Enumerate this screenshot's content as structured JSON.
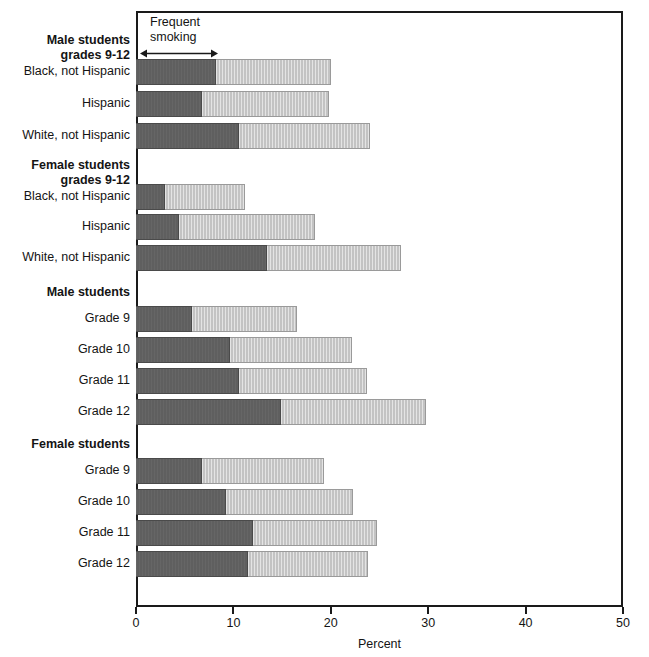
{
  "chart_data": {
    "type": "bar",
    "orientation": "horizontal",
    "stacked": true,
    "title": "",
    "xlabel": "Percent",
    "ylabel": "",
    "xlim": [
      0,
      50
    ],
    "xticks": [
      0,
      10,
      20,
      30,
      40,
      50
    ],
    "xtick_labels": [
      "0",
      "10",
      "20",
      "30",
      "40",
      "50"
    ],
    "grid": false,
    "legend_position": "none",
    "annotation": {
      "text_line1": "Frequent",
      "text_line2": "smoking",
      "arrow_from": 0,
      "arrow_to": 8
    },
    "series": [
      {
        "name": "Frequent smoking",
        "color": "#5f5f5f"
      },
      {
        "name": "Current smoking (remainder)",
        "color": "#c3c3c3"
      }
    ],
    "groups": [
      {
        "heading_line1": "Male students",
        "heading_line2": "grades 9-12",
        "rows": [
          {
            "label": "Black, not Hispanic",
            "frequent": 8.2,
            "total": 20.0
          },
          {
            "label": "Hispanic",
            "frequent": 6.8,
            "total": 19.8
          },
          {
            "label": "White, not Hispanic",
            "frequent": 10.6,
            "total": 24.0
          }
        ]
      },
      {
        "heading_line1": "Female students",
        "heading_line2": "grades 9-12",
        "rows": [
          {
            "label": "Black, not Hispanic",
            "frequent": 3.0,
            "total": 11.2
          },
          {
            "label": "Hispanic",
            "frequent": 4.4,
            "total": 18.4
          },
          {
            "label": "White, not Hispanic",
            "frequent": 13.5,
            "total": 27.2
          }
        ]
      },
      {
        "heading_line1": "Male students",
        "heading_line2": "",
        "rows": [
          {
            "label": "Grade 9",
            "frequent": 5.8,
            "total": 16.5
          },
          {
            "label": "Grade 10",
            "frequent": 9.6,
            "total": 22.2
          },
          {
            "label": "Grade 11",
            "frequent": 10.6,
            "total": 23.7
          },
          {
            "label": "Grade 12",
            "frequent": 14.9,
            "total": 29.8
          }
        ]
      },
      {
        "heading_line1": "Female students",
        "heading_line2": "",
        "rows": [
          {
            "label": "Grade 9",
            "frequent": 6.8,
            "total": 19.3
          },
          {
            "label": "Grade 10",
            "frequent": 9.2,
            "total": 22.3
          },
          {
            "label": "Grade 11",
            "frequent": 12.0,
            "total": 24.7
          },
          {
            "label": "Grade 12",
            "frequent": 11.5,
            "total": 23.8
          }
        ]
      }
    ]
  },
  "axis": {
    "x_title": "Percent",
    "ticks": [
      "0",
      "10",
      "20",
      "30",
      "40",
      "50"
    ]
  },
  "labels": {
    "male_9_12_line1": "Male students",
    "male_9_12_line2": "grades 9-12",
    "female_9_12_line1": "Female students",
    "female_9_12_line2": "grades 9-12",
    "male_students": "Male students",
    "female_students": "Female students",
    "black": "Black, not Hispanic",
    "hispanic": "Hispanic",
    "white": "White, not Hispanic",
    "grade9": "Grade 9",
    "grade10": "Grade 10",
    "grade11": "Grade 11",
    "grade12": "Grade 12"
  },
  "annotation": {
    "line1": "Frequent",
    "line2": "smoking"
  }
}
